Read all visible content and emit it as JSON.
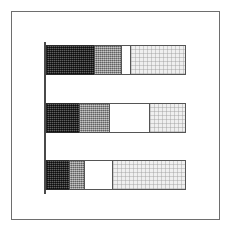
{
  "chart_data": {
    "type": "bar",
    "orientation": "horizontal",
    "stacked": true,
    "normalized_percent": true,
    "title": "",
    "subtitle": "",
    "xlabel": "",
    "ylabel": "",
    "xlim": [
      0,
      100
    ],
    "grid": false,
    "legend": "none",
    "axis": {
      "category_axis": "vertical-left",
      "value_axis_visible": false,
      "tick_labels": []
    },
    "categories": [
      "",
      "",
      ""
    ],
    "series": [
      {
        "name": "segment-1-dark",
        "pattern": "dense-cross-hatch",
        "color": "#3a3a3a",
        "values": [
          35,
          24,
          17
        ]
      },
      {
        "name": "segment-2-gray",
        "pattern": "gray-stipple",
        "color": "#8d8d8d",
        "values": [
          19,
          22,
          11
        ]
      },
      {
        "name": "segment-3-white",
        "pattern": "solid-white",
        "color": "#ffffff",
        "values": [
          7,
          28,
          20
        ]
      },
      {
        "name": "segment-4-light",
        "pattern": "fine-light-grid",
        "color": "#efefef",
        "values": [
          39,
          26,
          52
        ]
      }
    ],
    "bars": [
      {
        "name": "bar-1",
        "segments": [
          {
            "label": "segment-1-dark",
            "value": 35
          },
          {
            "label": "segment-2-gray",
            "value": 19
          },
          {
            "label": "segment-3-white",
            "value": 7
          },
          {
            "label": "segment-4-light",
            "value": 39
          }
        ]
      },
      {
        "name": "bar-2",
        "segments": [
          {
            "label": "segment-1-dark",
            "value": 24
          },
          {
            "label": "segment-2-gray",
            "value": 22
          },
          {
            "label": "segment-3-white",
            "value": 28
          },
          {
            "label": "segment-4-light",
            "value": 26
          }
        ]
      },
      {
        "name": "bar-3",
        "segments": [
          {
            "label": "segment-1-dark",
            "value": 17
          },
          {
            "label": "segment-2-gray",
            "value": 11
          },
          {
            "label": "segment-3-white",
            "value": 20
          },
          {
            "label": "segment-4-light",
            "value": 52
          }
        ]
      }
    ],
    "colors": {
      "frame_border": "#6e6e6e",
      "axis_line": "#4a4a4a",
      "segment_border": "#555555",
      "background": "#ffffff"
    }
  }
}
